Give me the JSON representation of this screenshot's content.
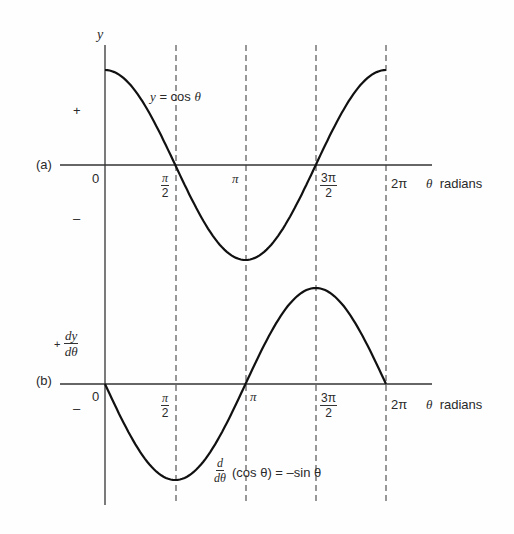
{
  "chart_data": [
    {
      "type": "line",
      "panel": "(a)",
      "title": "",
      "xlabel": "θ radians",
      "ylabel": "y",
      "series": [
        {
          "name": "y = cos θ",
          "x": [
            0,
            0.785,
            1.571,
            2.356,
            3.1416,
            3.927,
            4.712,
            5.498,
            6.283
          ],
          "values": [
            1,
            0.707,
            0,
            -0.707,
            -1,
            -0.707,
            0,
            0.707,
            1
          ]
        }
      ],
      "xticks": [
        "0",
        "π/2",
        "π",
        "3π/2",
        "2π"
      ],
      "ysigns": [
        "+",
        "−"
      ],
      "xlim": [
        0,
        6.283
      ],
      "ylim": [
        -1,
        1
      ],
      "grid": "dashed vertical lines at π/2, π, 3π/2, 2π"
    },
    {
      "type": "line",
      "panel": "(b)",
      "title": "",
      "xlabel": "θ radians",
      "ylabel": "dy/dθ",
      "series": [
        {
          "name": "d/dθ(cos θ) = −sin θ",
          "x": [
            0,
            0.785,
            1.571,
            2.356,
            3.1416,
            3.927,
            4.712,
            5.498,
            6.283
          ],
          "values": [
            0,
            -0.707,
            -1,
            -0.707,
            0,
            0.707,
            1,
            0.707,
            0
          ]
        }
      ],
      "xticks": [
        "0",
        "π/2",
        "π",
        "3π/2",
        "2π"
      ],
      "ysigns": [
        "+",
        "−"
      ],
      "xlim": [
        0,
        6.283
      ],
      "ylim": [
        -1,
        1
      ]
    }
  ],
  "labels": {
    "y_axis": "y",
    "curve_a": "y = cos θ",
    "panel_a": "(a)",
    "panel_b": "(b)",
    "plus": "+",
    "minus": "–",
    "zero": "0",
    "pi": "π",
    "two_pi": "2π",
    "pi_num": "π",
    "three_pi_num": "3π",
    "den": "2",
    "theta": "θ",
    "radians": "radians",
    "dy": "dy",
    "dtheta": "dθ",
    "d": "d",
    "deriv_rest": "(cos θ) = –sin θ"
  }
}
